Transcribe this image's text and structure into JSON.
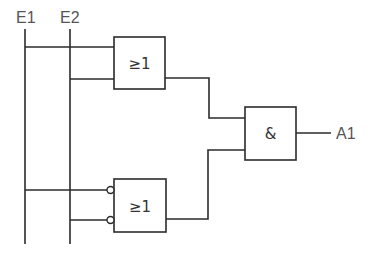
{
  "diagram": {
    "type": "logic-circuit",
    "inputs": [
      {
        "id": "E1",
        "label": "E1"
      },
      {
        "id": "E2",
        "label": "E2"
      }
    ],
    "outputs": [
      {
        "id": "A1",
        "label": "A1"
      }
    ],
    "gates": [
      {
        "id": "or1",
        "type": "OR",
        "symbol": "≥1",
        "inputs": [
          "E1",
          "E2"
        ],
        "inverted_inputs": [
          false,
          false
        ]
      },
      {
        "id": "or2",
        "type": "OR",
        "symbol": "≥1",
        "inputs": [
          "E1",
          "E2"
        ],
        "inverted_inputs": [
          true,
          true
        ]
      },
      {
        "id": "and1",
        "type": "AND",
        "symbol": "&",
        "inputs": [
          "or1",
          "or2"
        ],
        "output": "A1"
      }
    ],
    "colors": {
      "line": "#2b2b2b",
      "label": "#555555"
    }
  }
}
